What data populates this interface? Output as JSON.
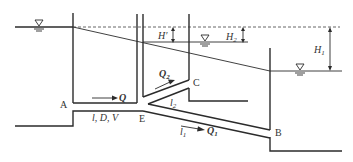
{
  "diagram": {
    "type": "branched pipe system between three reservoirs",
    "labels": {
      "point_a": "A",
      "point_b": "B",
      "point_c": "C",
      "point_e": "E",
      "pipe_main": "l, D, V",
      "flow_main": "Q",
      "flow_branch_1": "Q",
      "flow_branch_1_sub": "1",
      "flow_branch_2": "Q",
      "flow_branch_2_sub": "2",
      "length_branch_1": "l",
      "length_branch_1_sub": "1",
      "length_branch_2": "l",
      "length_branch_2_sub": "2",
      "head_loss_prime": "H′",
      "head_h1": "H",
      "head_h1_sub": "1",
      "head_h2": "H",
      "head_h2_sub": "2"
    },
    "symbols": {
      "water_surface": "water-surface-triangle"
    },
    "colors": {
      "stroke": "#2b2b2b",
      "text": "#333333",
      "background": "#ffffff"
    }
  }
}
